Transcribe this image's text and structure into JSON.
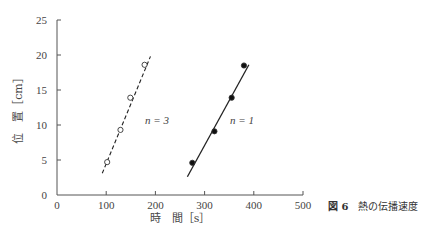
{
  "chart_data": {
    "type": "scatter",
    "title": "",
    "xlabel": "時　間［s］",
    "ylabel": "位　置［cm］",
    "xlim": [
      0,
      500
    ],
    "ylim": [
      0,
      25
    ],
    "xticks": [
      0,
      100,
      200,
      300,
      400,
      500
    ],
    "yticks": [
      0,
      5,
      10,
      15,
      20,
      25
    ],
    "grid": false,
    "legend": "inline labels",
    "series": [
      {
        "name": "n=3",
        "label": "n = 3",
        "marker": "open-circle",
        "line": "dashed",
        "x": [
          102,
          129,
          149,
          178
        ],
        "y": [
          4.7,
          9.3,
          13.9,
          18.6
        ],
        "fit_line": {
          "x": [
            92,
            190
          ],
          "y": [
            3.1,
            19.8
          ]
        }
      },
      {
        "name": "n=1",
        "label": "n = 1",
        "marker": "filled-circle",
        "line": "solid",
        "x": [
          275,
          320,
          355,
          380
        ],
        "y": [
          4.6,
          9.1,
          13.9,
          18.5
        ],
        "fit_line": {
          "x": [
            265,
            390
          ],
          "y": [
            2.6,
            18.6
          ]
        }
      }
    ]
  },
  "caption": {
    "figure_number": "図 6",
    "text": "熱の伝播速度"
  },
  "labels": {
    "x_ticks": [
      "0",
      "100",
      "200",
      "300",
      "400",
      "500"
    ],
    "y_ticks": [
      "0",
      "5",
      "10",
      "15",
      "20",
      "25"
    ],
    "xlabel": "時　間［s］",
    "ylabel": "位　置［cm］",
    "series_n3": "n = 3",
    "series_n1": "n = 1"
  }
}
